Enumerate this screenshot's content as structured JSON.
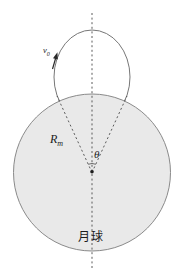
{
  "figure": {
    "type": "physics-orbit-diagram",
    "labels": {
      "velocity": {
        "base": "v",
        "sub": "0"
      },
      "radius": {
        "base": "R",
        "sub": "m"
      },
      "angle": "θ",
      "body": "月球"
    },
    "colors": {
      "background": "#ffffff",
      "moon_fill": "#e9e9e9",
      "moon_stroke": "#8a8a8a",
      "orbit_stroke": "#777777",
      "dash_stroke": "#4a4a4a",
      "text": "#1c1c1c"
    }
  }
}
